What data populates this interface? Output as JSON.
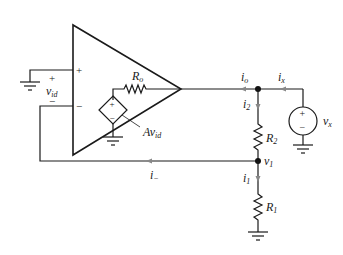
{
  "diagram": {
    "type": "op-amp equivalent circuit (output resistance measurement)",
    "labels": {
      "input_voltage": {
        "main": "v",
        "sub": "id"
      },
      "output_resistance": {
        "main": "R",
        "sub": "o"
      },
      "dependent_source": {
        "main": "Av",
        "sub": "id"
      },
      "output_current": {
        "main": "i",
        "sub": "o"
      },
      "test_current": {
        "main": "i",
        "sub": "x"
      },
      "test_source": {
        "main": "v",
        "sub": "x"
      },
      "r2_current": {
        "main": "i",
        "sub": "2"
      },
      "r2": {
        "main": "R",
        "sub": "2"
      },
      "node_v1": {
        "main": "v",
        "sub": "1"
      },
      "r1_current": {
        "main": "i",
        "sub": "1"
      },
      "r1": {
        "main": "R",
        "sub": "1"
      },
      "inverting_current": {
        "main": "i",
        "sub": "−"
      }
    },
    "signs": {
      "plus": "+",
      "minus": "−"
    }
  }
}
